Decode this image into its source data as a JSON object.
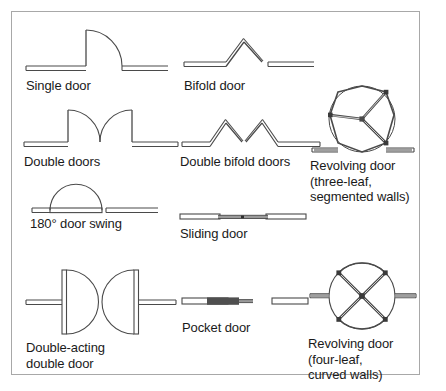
{
  "figure": {
    "background_color": "#ffffff",
    "border_color": "#a8a8a8",
    "line_color": "#4a4a4a",
    "text_color": "#1a1a1a",
    "door_fill_dark": "#4f4f4f",
    "door_fill_light": "#b4b4b4"
  },
  "symbols": [
    {
      "id": "single-door",
      "label": "Single door",
      "type": "swing",
      "leaves": 1,
      "swing_degrees": 90,
      "column": 1,
      "row": 1
    },
    {
      "id": "bifold-door",
      "label": "Bifold door",
      "type": "bifold",
      "leaves": 2,
      "folds": 1,
      "column": 2,
      "row": 1
    },
    {
      "id": "double-doors",
      "label": "Double doors",
      "type": "swing",
      "leaves": 2,
      "swing_degrees": 90,
      "column": 1,
      "row": 2
    },
    {
      "id": "double-bifold-doors",
      "label": "Double bifold doors",
      "type": "bifold",
      "leaves": 4,
      "folds": 2,
      "column": 2,
      "row": 2
    },
    {
      "id": "revolving-door-three-leaf",
      "label": "Revolving door\n(three-leaf,\nsegmented walls)",
      "type": "revolving",
      "leaves": 3,
      "wall_style": "segmented",
      "column": 3,
      "row": 2
    },
    {
      "id": "door-swing-180",
      "label": "180° door swing",
      "type": "swing",
      "leaves": 1,
      "swing_degrees": 180,
      "column": 1,
      "row": 3
    },
    {
      "id": "sliding-door",
      "label": "Sliding door",
      "type": "sliding",
      "leaves": 1,
      "column": 2,
      "row": 3
    },
    {
      "id": "double-acting-double-door",
      "label": "Double-acting\ndouble door",
      "type": "double-acting",
      "leaves": 2,
      "column": 1,
      "row": 4
    },
    {
      "id": "pocket-door",
      "label": "Pocket door",
      "type": "pocket",
      "leaves": 1,
      "column": 2,
      "row": 4
    },
    {
      "id": "revolving-door-four-leaf",
      "label": "Revolving door\n(four-leaf,\ncurved walls)",
      "type": "revolving",
      "leaves": 4,
      "wall_style": "curved",
      "column": 3,
      "row": 4
    }
  ]
}
